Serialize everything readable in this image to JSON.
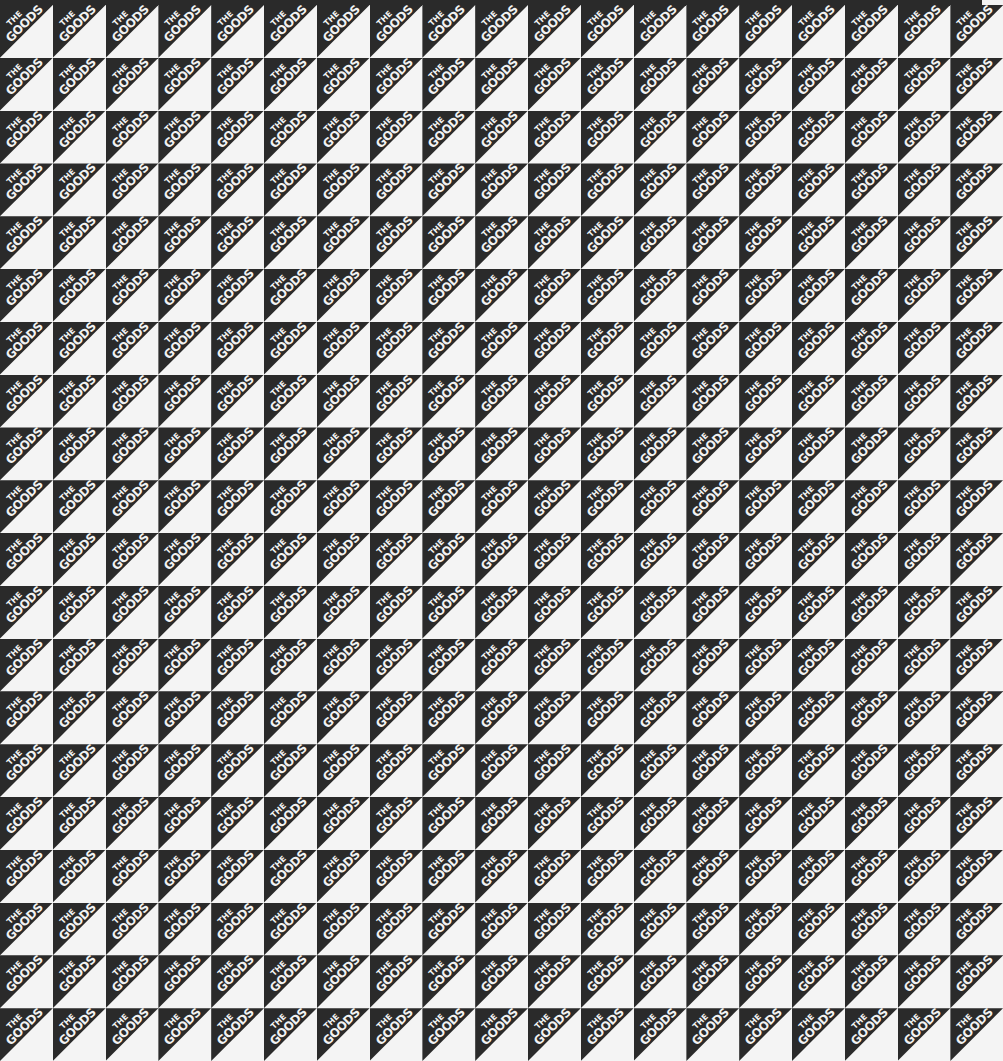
{
  "pattern": {
    "tile_text_line1": "THE",
    "tile_text_line2": "GOODS",
    "columns": 19,
    "rows": 20,
    "tile_size_px": 52.8,
    "colors": {
      "dark": "#2a2a2a",
      "light": "#f4f4f4",
      "text": "#f2f2f2"
    }
  }
}
